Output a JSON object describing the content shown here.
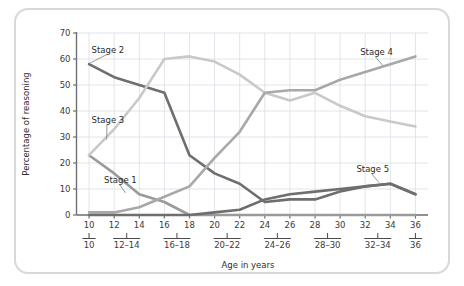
{
  "chart_data": {
    "type": "line",
    "title": "",
    "xlabel": "Age in years",
    "ylabel": "Percentage of reasoning",
    "x": [
      10,
      12,
      14,
      16,
      18,
      20,
      22,
      24,
      26,
      28,
      30,
      32,
      34,
      36
    ],
    "xlim": [
      9,
      37
    ],
    "ylim": [
      0,
      70
    ],
    "x_tick_labels": [
      "10",
      "12",
      "14",
      "16",
      "18",
      "20",
      "22",
      "24",
      "26",
      "28",
      "30",
      "32",
      "34",
      "36"
    ],
    "y_tick_labels": [
      "0",
      "10",
      "20",
      "30",
      "40",
      "50",
      "60",
      "70"
    ],
    "y_ticks": [
      0,
      10,
      20,
      30,
      40,
      50,
      60,
      70
    ],
    "x_group_labels": [
      "10",
      "12–14",
      "16–18",
      "20–22",
      "24–26",
      "28–30",
      "32–34",
      "36"
    ],
    "x_group_centers": [
      10,
      13,
      17,
      21,
      25,
      29,
      33,
      36
    ],
    "grid": true,
    "legend_position": "inline-annotations",
    "series": [
      {
        "name": "Stage 1",
        "color": "#9a9a9a",
        "values": [
          23,
          16,
          8,
          5,
          0,
          0,
          0,
          0,
          0,
          0,
          0,
          0,
          0,
          0
        ],
        "label_x": 11.2,
        "label_y": 12.5,
        "leader_to_x": 12.9,
        "leader_to_y": 8.5
      },
      {
        "name": "Stage 2",
        "color": "#6e6e6e",
        "values": [
          58,
          53,
          50,
          47,
          23,
          16,
          12,
          5,
          6,
          6,
          9,
          11,
          12,
          8
        ],
        "label_x": 10.2,
        "label_y": 62.5,
        "leader_to_x": 10.1,
        "leader_to_y": 58.5
      },
      {
        "name": "Stage 3",
        "color": "#c9c9c9",
        "values": [
          23,
          33,
          45,
          60,
          61,
          59,
          54,
          47,
          44,
          47,
          42,
          38,
          36,
          34
        ],
        "label_x": 10.2,
        "label_y": 35.5,
        "leader_to_x": 11.4,
        "leader_to_y": 29.0
      },
      {
        "name": "Stage 4",
        "color": "#a8a8a8",
        "values": [
          1,
          1,
          3,
          7,
          11,
          22,
          32,
          47,
          48,
          48,
          52,
          55,
          58,
          61
        ],
        "label_x": 31.6,
        "label_y": 61.5,
        "leader_to_x": 33.4,
        "leader_to_y": 57.5
      },
      {
        "name": "Stage 5",
        "color": "#6e6e6e",
        "values": [
          0,
          0,
          0,
          0,
          0,
          1,
          2,
          6,
          8,
          9,
          10,
          11,
          12,
          8
        ],
        "label_x": 31.3,
        "label_y": 16.5,
        "leader_to_x": 33.1,
        "leader_to_y": 12.5
      }
    ]
  },
  "axes": {
    "y_axis_title": "Percentage of reasoning",
    "x_axis_title": "Age in years"
  }
}
